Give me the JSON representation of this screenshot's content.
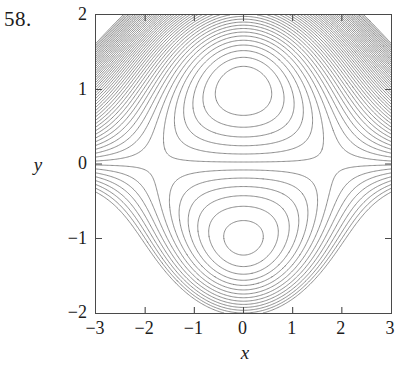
{
  "figure": {
    "number_label": "58.",
    "caption": ""
  },
  "axes": {
    "x_axis": {
      "name": "x",
      "min": -3,
      "max": 3,
      "tick_values": [
        -3,
        -2,
        -1,
        0,
        1,
        2,
        3
      ],
      "tick_labels": [
        "−3",
        "−2",
        "−1",
        "0",
        "1",
        "2",
        "3"
      ]
    },
    "y_axis": {
      "name": "y",
      "min": -2,
      "max": 2,
      "tick_values": [
        2,
        1,
        0,
        -1,
        -2
      ],
      "tick_labels": [
        "2",
        "1",
        "0",
        "−1",
        "−2"
      ]
    },
    "frame_color": "#4a4a4a",
    "background_color": "#ffffff",
    "grid": false
  },
  "chart_data": {
    "type": "contour",
    "title": "",
    "subtitle": "",
    "xlabel": "x",
    "ylabel": "y",
    "xlim": [
      -3,
      3
    ],
    "ylim": [
      -2,
      2
    ],
    "xticks": [
      -3,
      -2,
      -1,
      0,
      1,
      2,
      3
    ],
    "yticks": [
      -2,
      -1,
      0,
      1,
      2
    ],
    "grid": false,
    "legend": null,
    "line_color": "#707070",
    "line_width": 0.8,
    "filled": false,
    "labels_on_contours": false,
    "function_expression": "f(x, y) = 3*y - y^3 - x^2*y",
    "level_spacing": 0.32,
    "level_min": -14.0,
    "level_max": 2.6,
    "features": [
      {
        "kind": "local-maximum",
        "x": 0,
        "y": 1,
        "description": "nested closed oval contours centered near (0, 1)"
      },
      {
        "kind": "saddle",
        "x": -1.5,
        "y": -1,
        "description": "hyperbolic crossing of contours in lower-left quadrant"
      },
      {
        "kind": "saddle",
        "x": 1.5,
        "y": -1,
        "description": "hyperbolic crossing of contours in lower-right quadrant"
      },
      {
        "kind": "steep-region",
        "x": -3,
        "y": 2,
        "description": "densely packed near-vertical contours in upper-left corner"
      },
      {
        "kind": "steep-region",
        "x": 3,
        "y": 2,
        "description": "densely packed near-vertical contours in upper-right corner"
      },
      {
        "kind": "nested-arcs",
        "x": 0,
        "y": -2,
        "description": "concentric arcs opening upward along the bottom edge"
      }
    ]
  }
}
